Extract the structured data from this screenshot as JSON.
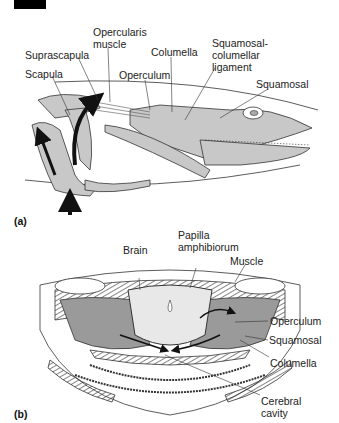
{
  "panels": [
    {
      "id": "a",
      "panel_label": "(a)",
      "labels": {
        "opercularis": "Opercularis\nmuscle",
        "suprascapula": "Suprascapula",
        "scapula": "Scapula",
        "columella": "Columella",
        "operculum": "Operculum",
        "squamosal_lig": "Squamosal-\ncolumellar\nligament",
        "squamosal": "Squamosal"
      }
    },
    {
      "id": "b",
      "panel_label": "(b)",
      "labels": {
        "brain": "Brain",
        "papilla": "Papilla\namphibiorum",
        "muscle": "Muscle",
        "operculum": "Operculum",
        "squamosal": "Squamosal",
        "columella": "Columella",
        "cerebral": "Cerebral\ncavity"
      }
    }
  ],
  "colors": {
    "fill_gray": "#c8c8c8",
    "fill_dark": "#9a9a9a",
    "line": "#333333",
    "arrow": "#111111"
  }
}
